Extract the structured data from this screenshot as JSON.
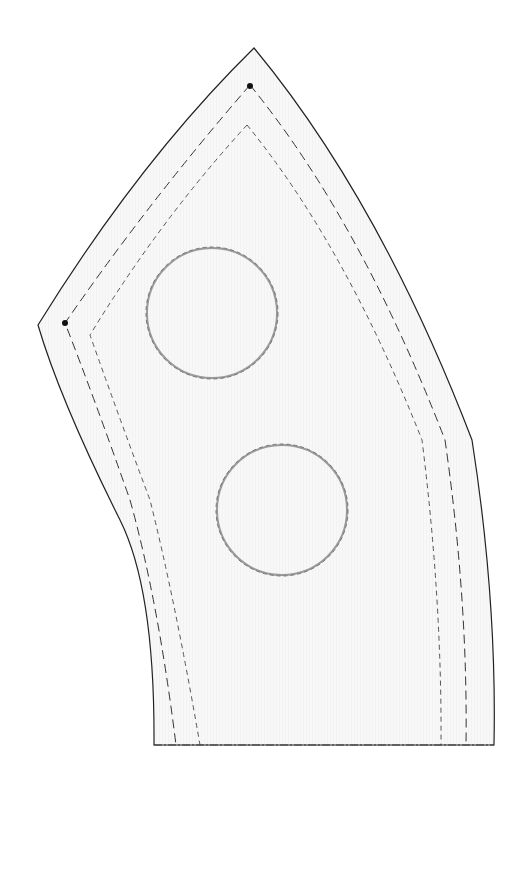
{
  "pattern": {
    "piece_letter": "B",
    "cut_instruction": "Cut 98 from pink.",
    "seam_allowance_label": "¼\" seam allowance",
    "quilting_line_label": "Quilting line",
    "grain_label": "Straight of grain",
    "circle_note": [
      "On plastic",
      "template only,",
      "cut out circles",
      "for appliqué",
      "placement."
    ],
    "fold_note": "Place on fold to complete pattern.",
    "circle_count": 3
  },
  "colors": {
    "fill": "#f7f7f7",
    "outline": "#222222",
    "circle_stroke": "#9a9a9a"
  }
}
